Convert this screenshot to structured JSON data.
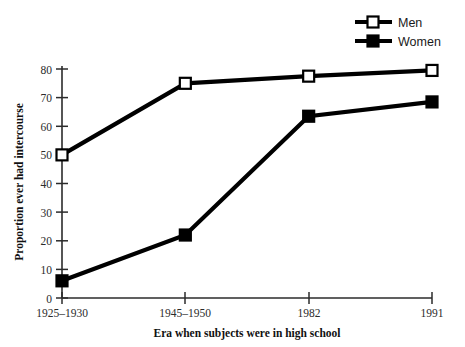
{
  "chart_data": {
    "type": "line",
    "title": "",
    "subtitle": "",
    "xlabel": "Era  when subjects  were in high school",
    "ylabel": "Proportion ever had intercourse",
    "categories": [
      "1925–1930",
      "1945–1950",
      "1982",
      "1991"
    ],
    "series": [
      {
        "name": "Men",
        "marker": "open-square",
        "color": "#000000",
        "values": [
          50,
          75,
          77.5,
          79.5
        ]
      },
      {
        "name": "Women",
        "marker": "filled-square",
        "color": "#000000",
        "values": [
          6,
          22,
          63.5,
          68.5
        ]
      }
    ],
    "ylim": [
      0,
      80
    ],
    "yticks": [
      0,
      10,
      20,
      30,
      40,
      50,
      60,
      70,
      80
    ],
    "ytick_labels": [
      "0",
      "10",
      "20",
      "30",
      "40",
      "50",
      "60",
      "70",
      "80"
    ],
    "xtick_labels": [
      "1925–1930",
      "1945–1950",
      "1982",
      "1991"
    ],
    "grid": false,
    "legend_position": "top-right"
  },
  "legend": {
    "entries": [
      {
        "label": "Men",
        "marker": "open-square"
      },
      {
        "label": "Women",
        "marker": "filled-square"
      }
    ]
  },
  "axes": {
    "y_title": "Proportion ever had intercourse",
    "x_title": "Era  when subjects  were in high school"
  }
}
